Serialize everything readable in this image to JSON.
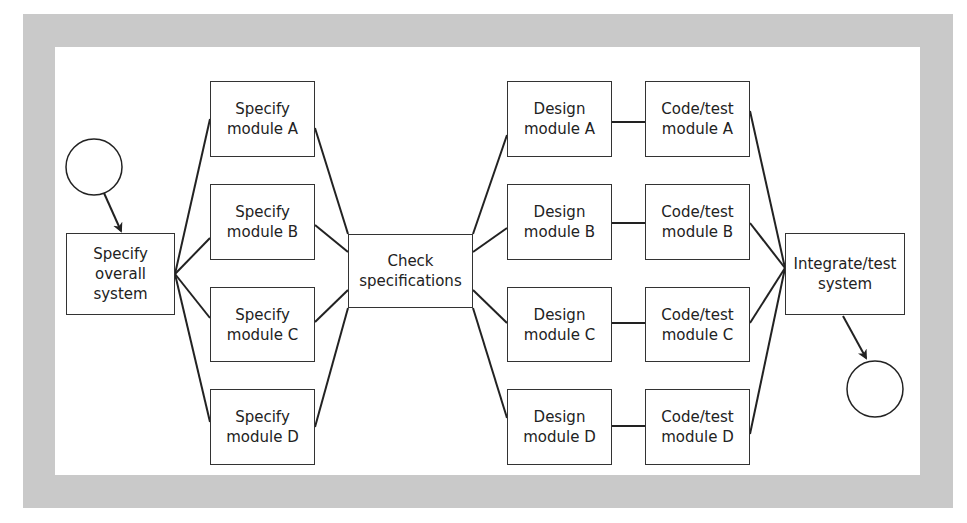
{
  "diagram": {
    "colors": {
      "frame": "#c9c9c9",
      "line": "#222222",
      "box_border": "#333333",
      "background": "#ffffff"
    },
    "nodes": {
      "start": {
        "type": "start-circle"
      },
      "specify_overall": {
        "label": "Specify\noverall\nsystem"
      },
      "specify_a": {
        "label": "Specify\nmodule A"
      },
      "specify_b": {
        "label": "Specify\nmodule B"
      },
      "specify_c": {
        "label": "Specify\nmodule C"
      },
      "specify_d": {
        "label": "Specify\nmodule D"
      },
      "check": {
        "label": "Check\nspecifications"
      },
      "design_a": {
        "label": "Design\nmodule A"
      },
      "design_b": {
        "label": "Design\nmodule B"
      },
      "design_c": {
        "label": "Design\nmodule C"
      },
      "design_d": {
        "label": "Design\nmodule D"
      },
      "code_a": {
        "label": "Code/test\nmodule A"
      },
      "code_b": {
        "label": "Code/test\nmodule B"
      },
      "code_c": {
        "label": "Code/test\nmodule C"
      },
      "code_d": {
        "label": "Code/test\nmodule D"
      },
      "integrate": {
        "label": "Integrate/test\nsystem"
      },
      "end": {
        "type": "end-circle"
      }
    },
    "edges": [
      [
        "start",
        "specify_overall"
      ],
      [
        "specify_overall",
        "specify_a"
      ],
      [
        "specify_overall",
        "specify_b"
      ],
      [
        "specify_overall",
        "specify_c"
      ],
      [
        "specify_overall",
        "specify_d"
      ],
      [
        "specify_a",
        "check"
      ],
      [
        "specify_b",
        "check"
      ],
      [
        "specify_c",
        "check"
      ],
      [
        "specify_d",
        "check"
      ],
      [
        "check",
        "design_a"
      ],
      [
        "check",
        "design_b"
      ],
      [
        "check",
        "design_c"
      ],
      [
        "check",
        "design_d"
      ],
      [
        "design_a",
        "code_a"
      ],
      [
        "design_b",
        "code_b"
      ],
      [
        "design_c",
        "code_c"
      ],
      [
        "design_d",
        "code_d"
      ],
      [
        "code_a",
        "integrate"
      ],
      [
        "code_b",
        "integrate"
      ],
      [
        "code_c",
        "integrate"
      ],
      [
        "code_d",
        "integrate"
      ],
      [
        "integrate",
        "end"
      ]
    ]
  }
}
